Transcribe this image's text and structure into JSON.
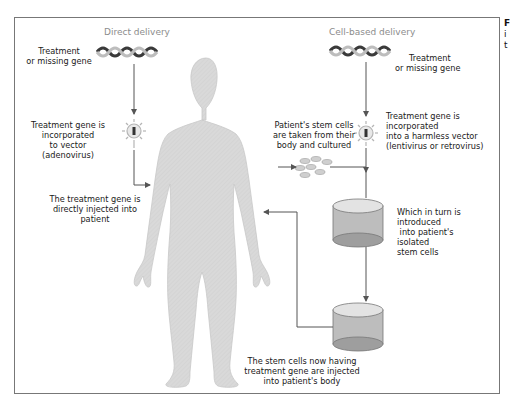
{
  "diagram": {
    "sections": {
      "direct": "Direct delivery",
      "cell_based": "Cell-based delivery"
    },
    "direct_steps": {
      "gene_line1": "Treatment",
      "gene_line2": "or missing gene",
      "vector_line1": "Treatment gene is",
      "vector_line2": "incorporated",
      "vector_line3": "to vector",
      "vector_line4": "(adenovirus)",
      "inject_line1": "The treatment gene is",
      "inject_line2": "directly injected into",
      "inject_line3": "patient"
    },
    "cell_steps": {
      "gene_line1": "Treatment",
      "gene_line2": "or missing gene",
      "vector_line1": "Treatment gene is",
      "vector_line2": "incorporated",
      "vector_line3": "into a harmless vector",
      "vector_line4": "(lentivirus or retrovirus)",
      "stem_line1": "Patient's stem cells",
      "stem_line2": "are taken from their",
      "stem_line3": "body and cultured",
      "dish_line1": "Which in turn is",
      "dish_line2": "introduced",
      "dish_line3": " into patient's",
      "dish_line4": "isolated",
      "dish_line5": "stem cells",
      "final_line1": "The stem cells now having",
      "final_line2": "treatment gene are injected",
      "final_line3": "into patient's body"
    },
    "cutoff_caption": {
      "line1": "F",
      "line2": "i",
      "line3": "t"
    },
    "colors": {
      "body": "#d6d6d6",
      "arrow": "#555555",
      "section_label": "#8c8c8c",
      "dna_dark": "#3a3a3a",
      "dna_light": "#bdbdbd"
    }
  }
}
